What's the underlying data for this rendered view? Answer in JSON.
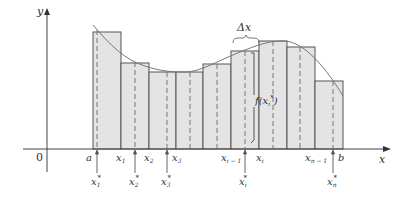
{
  "diagram": {
    "colors": {
      "axis": "#444444",
      "rect_fill": "#e4e4e4",
      "rect_stroke": "#555555",
      "curve": "#777777",
      "dashed": "#777777",
      "text": "#333333"
    },
    "axes": {
      "y_label": "y",
      "x_label": "x",
      "origin_label": "0"
    },
    "partition_labels": {
      "a": "a",
      "x1": "x",
      "x1_sub": "1",
      "x2": "x",
      "x2_sub": "2",
      "x3": "x",
      "x3_sub": "3",
      "xim1": "x",
      "xim1_sub": "i − 1",
      "xi": "x",
      "xi_sub": "i",
      "xnm1": "x",
      "xnm1_sub": "n − 1",
      "b": "b"
    },
    "sample_labels": {
      "x1s": "x",
      "x1s_sub": "1",
      "x2s": "x",
      "x2s_sub": "2",
      "x3s": "x",
      "x3s_sub": "3",
      "xis": "x",
      "xis_sub": "i",
      "xns": "x",
      "xns_sub": "n",
      "star": "*"
    },
    "annotations": {
      "delta_x": "Δx",
      "f_xi_star": "f(x",
      "f_xi_star_sub": "i",
      "f_xi_star_sup": "*",
      "f_close": ")"
    },
    "rectangles": [
      {
        "x0": 93,
        "x1": 121,
        "top": 32
      },
      {
        "x0": 121,
        "x1": 149,
        "top": 63
      },
      {
        "x0": 149,
        "x1": 176,
        "top": 72
      },
      {
        "x0": 176,
        "x1": 203,
        "top": 72
      },
      {
        "x0": 203,
        "x1": 231,
        "top": 64
      },
      {
        "x0": 231,
        "x1": 259,
        "top": 51
      },
      {
        "x0": 259,
        "x1": 287,
        "top": 41
      },
      {
        "x0": 287,
        "x1": 315,
        "top": 47
      },
      {
        "x0": 315,
        "x1": 343,
        "top": 81
      }
    ]
  }
}
